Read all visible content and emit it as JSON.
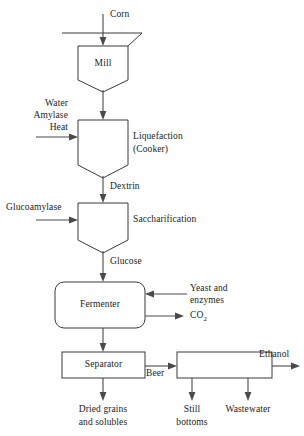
{
  "diagram": {
    "units": {
      "mill": "Mill",
      "liquefaction_line1": "Liquefaction",
      "liquefaction_line2": "(Cooker)",
      "saccharification": "Saccharification",
      "fermenter": "Fermenter",
      "separator": "Separator",
      "distillation": ""
    },
    "streams": {
      "corn": "Corn",
      "water": "Water",
      "amylase": "Amylase",
      "heat": "Heat",
      "dextrin": "Dextrin",
      "glucoamylase": "Glucoamylase",
      "glucose": "Glucose",
      "yeast_line1": "Yeast and",
      "yeast_line2": "enzymes",
      "co2_text": "CO",
      "co2_sub": "2",
      "beer": "Beer",
      "ethanol": "Ethanol",
      "dried_grains_line1": "Dried grains",
      "dried_grains_line2": "and solubles",
      "still_line1": "Still",
      "still_line2": "bottoms",
      "wastewater": "Wastewater"
    },
    "colors": {
      "stroke": "#3a3a3a",
      "line": "#4a4a4a",
      "text": "#1b1b1b",
      "background": "#ffffff"
    }
  }
}
